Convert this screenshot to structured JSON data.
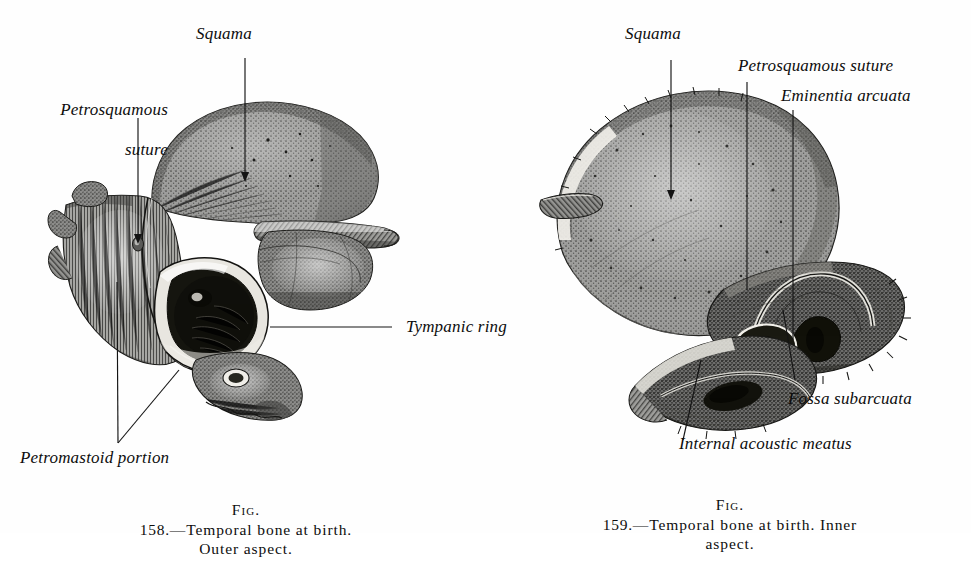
{
  "page": {
    "background_color": "#fefefe",
    "ink_color": "#111111",
    "plate_title": "Temporal bone at birth"
  },
  "figures": [
    {
      "id": "fig-158",
      "side": "left",
      "subject": "Temporal bone at birth, outer aspect",
      "caption": {
        "fig_word": "Fig.",
        "number": "158.",
        "dash": "—",
        "line1": "Temporal bone at birth.",
        "line2": "Outer aspect.",
        "full": "Fig. 158.—Temporal bone at birth. Outer aspect."
      },
      "labels": [
        {
          "name": "squama",
          "text": "Squama",
          "lines": [
            "Squama"
          ],
          "align": "center"
        },
        {
          "name": "petrosquamous-suture",
          "text": "Petrosquamous suture",
          "lines": [
            "Petrosquamous",
            "suture"
          ],
          "align": "right"
        },
        {
          "name": "tympanic-ring",
          "text": "Tympanic ring",
          "lines": [
            "Tympanic ring"
          ],
          "align": "left"
        },
        {
          "name": "petromastoid-portion",
          "text": "Petromastoid portion",
          "lines": [
            "Petromastoid portion"
          ],
          "align": "left"
        }
      ]
    },
    {
      "id": "fig-159",
      "side": "right",
      "subject": "Temporal bone at birth, inner aspect",
      "caption": {
        "fig_word": "Fig.",
        "number": "159.",
        "dash": "—",
        "line1": "Temporal bone at birth.   Inner",
        "line2": "aspect.",
        "full": "Fig. 159.—Temporal bone at birth.   Inner aspect."
      },
      "labels": [
        {
          "name": "squama",
          "text": "Squama",
          "lines": [
            "Squama"
          ],
          "align": "center"
        },
        {
          "name": "petrosquamous-suture",
          "text": "Petrosquamous suture",
          "lines": [
            "Petrosquamous suture"
          ],
          "align": "left"
        },
        {
          "name": "eminentia-arcuata",
          "text": "Eminentia arcuata",
          "lines": [
            "Eminentia arcuata"
          ],
          "align": "left"
        },
        {
          "name": "fossa-subarcuata",
          "text": "Fossa subarcuata",
          "lines": [
            "Fossa subarcuata"
          ],
          "align": "left"
        },
        {
          "name": "internal-acoustic-meatus",
          "text": "Internal acoustic meatus",
          "lines": [
            "Internal acoustic meatus"
          ],
          "align": "left"
        }
      ]
    }
  ]
}
